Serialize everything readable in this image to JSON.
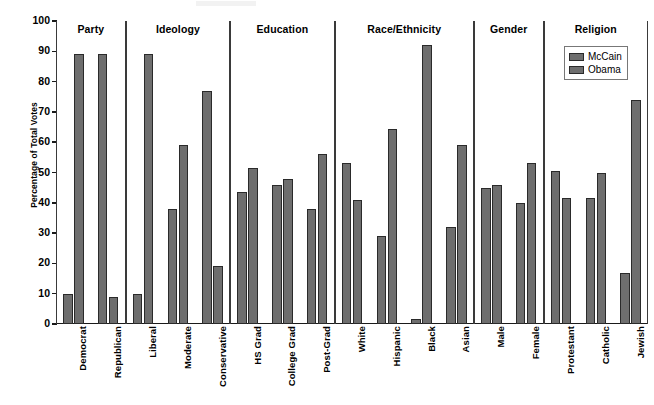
{
  "chart_data": {
    "type": "bar",
    "title": "",
    "xlabel": "",
    "ylabel": "Percentage of Total Votes",
    "ylim": [
      0,
      100
    ],
    "ytick_step": 10,
    "yticks": [
      0,
      10,
      20,
      30,
      40,
      50,
      60,
      70,
      80,
      90,
      100
    ],
    "grid": false,
    "legend_position": "top-right",
    "orientation": "vertical",
    "categories": [
      "Democrat",
      "Republican",
      "Liberal",
      "Moderate",
      "Conservative",
      "HS Grad",
      "College Grad",
      "Post-Grad",
      "White",
      "Hispanic",
      "Black",
      "Asian",
      "Male",
      "Female",
      "Protestant",
      "Catholic",
      "Jewish"
    ],
    "series": [
      {
        "name": "McCain",
        "color": "#6e6e6e",
        "values": [
          10,
          89,
          10,
          38,
          77,
          43.5,
          46,
          38,
          53,
          29,
          1.5,
          32,
          45,
          40,
          50.5,
          41.5,
          17
        ]
      },
      {
        "name": "Obama",
        "color": "#6e6e6e",
        "values": [
          89,
          9,
          89,
          59,
          19,
          51.5,
          48,
          56,
          41,
          64.5,
          92,
          59,
          46,
          53,
          41.5,
          50,
          74
        ]
      }
    ],
    "groups": [
      {
        "label": "Party",
        "categories": [
          "Democrat",
          "Republican"
        ]
      },
      {
        "label": "Ideology",
        "categories": [
          "Liberal",
          "Moderate",
          "Conservative"
        ]
      },
      {
        "label": "Education",
        "categories": [
          "HS Grad",
          "College Grad",
          "Post-Grad"
        ]
      },
      {
        "label": "Race/Ethnicity",
        "categories": [
          "White",
          "Hispanic",
          "Black",
          "Asian"
        ]
      },
      {
        "label": "Gender",
        "categories": [
          "Male",
          "Female"
        ]
      },
      {
        "label": "Religion",
        "categories": [
          "Protestant",
          "Catholic",
          "Jewish"
        ]
      }
    ],
    "legend": [
      {
        "label": "McCain",
        "color": "#6e6e6e"
      },
      {
        "label": "Obama",
        "color": "#6e6e6e"
      }
    ]
  }
}
